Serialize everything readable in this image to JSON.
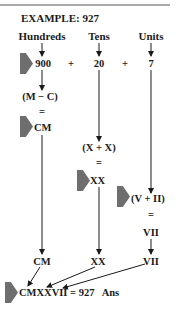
{
  "title": "EXAMPLE: 927",
  "columns": {
    "hundreds": "Hundreds",
    "tens": "Tens",
    "units": "Units"
  },
  "expansion": {
    "hundreds_value": "900",
    "plus1": "+",
    "tens_value": "20",
    "plus2": "+",
    "units_value": "7"
  },
  "hundreds_steps": {
    "expr": "(M − C)",
    "equals": "=",
    "result": "CM"
  },
  "tens_steps": {
    "expr": "(X + X)",
    "equals": "=",
    "result": "XX"
  },
  "units_steps": {
    "expr": "(V + II)",
    "equals": "=",
    "result": "VII"
  },
  "collected": {
    "hundreds": "CM",
    "tens": "XX",
    "units": "VII"
  },
  "answer": {
    "text": "CMXXVII = 927   Ans"
  },
  "colors": {
    "pointer_shape": "#6e6e6e",
    "ink": "#1a1a1a"
  }
}
